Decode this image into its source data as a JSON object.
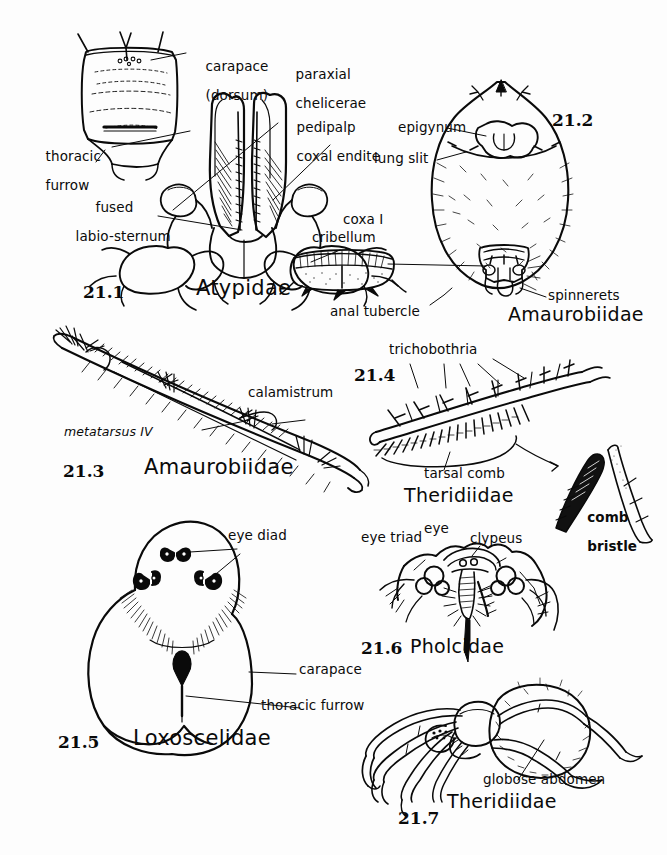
{
  "plate": {
    "title": "Spider external morphology plate 21",
    "background_color": "#fdfdfd",
    "ink_color": "#0a0a0a"
  },
  "figures": [
    {
      "id": "21.1",
      "number": "21.1",
      "family": "Atypidae",
      "subject": "ventral prosoma showing carapace, chelicerae, pedipalp coxal endites and fused labio-sternum",
      "labels": [
        "carapace\n(dorsum)",
        "paraxial\nchelicerae",
        "pedipalp\ncoxal endite",
        "thoracic\nfurrow",
        "fused\nlabio-sternum",
        "coxa I"
      ]
    },
    {
      "id": "21.2",
      "number": "21.2",
      "family": "Amaurobiidae",
      "subject": "ventral abdomen showing epigynum, lung slits, cribellum, anal tubercle and spinnerets",
      "labels": [
        "epigynum",
        "lung slit",
        "cribellum",
        "anal tubercle",
        "spinnerets"
      ]
    },
    {
      "id": "21.3",
      "number": "21.3",
      "family": "Amaurobiidae",
      "subject": "metatarsus IV bearing the calamistrum",
      "labels": [
        "calamistrum",
        "metatarsus IV"
      ]
    },
    {
      "id": "21.4",
      "number": "21.4",
      "family": "Theridiidae",
      "subject": "tarsus IV with tarsal comb and trichobothria, plus enlarged comb bristle",
      "labels": [
        "trichobothria",
        "tarsal comb",
        "comb\nbristle"
      ]
    },
    {
      "id": "21.5",
      "number": "21.5",
      "family": "Loxoscelidae",
      "subject": "dorsal carapace showing three eye diads and thoracic furrow",
      "labels": [
        "eye diad",
        "carapace",
        "thoracic furrow"
      ]
    },
    {
      "id": "21.6",
      "number": "21.6",
      "family": "Pholcidae",
      "subject": "anterior view of eye region showing eye triads and clypeus",
      "labels": [
        "eye triad",
        "eye",
        "clypeus"
      ]
    },
    {
      "id": "21.7",
      "number": "21.7",
      "family": "Theridiidae",
      "subject": "lateral habitus showing globose abdomen",
      "labels": [
        "globose abdomen"
      ]
    }
  ],
  "text_items": {
    "fig1": {
      "num": "21.1",
      "family": "Atypidae",
      "carapace_l1": "carapace",
      "carapace_l2": "(dorsum)",
      "paraxial_l1": "paraxial",
      "paraxial_l2": "chelicerae",
      "pedipalp_l1": "pedipalp",
      "pedipalp_l2": "coxal endite",
      "thoracic_l1": "thoracic",
      "thoracic_l2": "furrow",
      "fused_l1": "fused",
      "fused_l2": "labio-sternum",
      "coxa": "coxa I"
    },
    "fig2": {
      "num": "21.2",
      "family": "Amaurobiidae",
      "epigynum": "epigynum",
      "lung_slit": "lung slit",
      "cribellum": "cribellum",
      "anal_tubercle": "anal tubercle",
      "spinnerets": "spinnerets"
    },
    "fig3": {
      "num": "21.3",
      "family": "Amaurobiidae",
      "calamistrum": "calamistrum",
      "metatarsus": "metatarsus IV"
    },
    "fig4": {
      "num": "21.4",
      "family": "Theridiidae",
      "trichobothria": "trichobothria",
      "tarsal_comb": "tarsal comb",
      "comb_l1": "comb",
      "comb_l2": "bristle"
    },
    "fig5": {
      "num": "21.5",
      "family": "Loxoscelidae",
      "eye_diad": "eye diad",
      "carapace": "carapace",
      "thoracic_furrow": "thoracic furrow"
    },
    "fig6": {
      "num": "21.6",
      "family": "Pholcidae",
      "eye_triad": "eye triad",
      "eye": "eye",
      "clypeus": "clypeus"
    },
    "fig7": {
      "num": "21.7",
      "family": "Theridiidae",
      "globose_abdomen": "globose abdomen"
    }
  }
}
